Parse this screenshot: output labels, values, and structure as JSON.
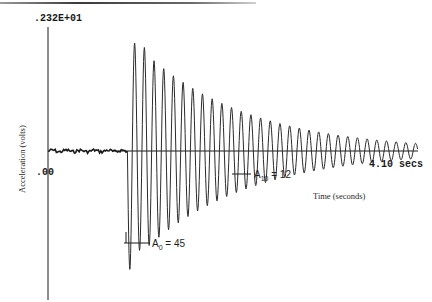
{
  "chart_data": {
    "type": "line",
    "title": "",
    "xlabel": "Time (seconds)",
    "ylabel": "Acceleration (volts)",
    "y_max_label": ".232E+01",
    "y_zero_label": ".00",
    "x_end_label": "4.10 secs",
    "ylim": [
      -2.32,
      2.32
    ],
    "xlim": [
      0,
      4.1
    ],
    "grid": false,
    "legend": null,
    "series": [
      {
        "name": "Acceleration",
        "description": "Damped free-vibration signal: flat noisy baseline until trigger (~0.9 s), then ~30 decaying oscillation cycles to 4.10 s",
        "trigger_time_s": 0.88,
        "approx_cycles": 30,
        "initial_amplitude_volts": 2.32,
        "final_amplitude_volts": 0.15
      }
    ],
    "annotations": [
      {
        "label": "A",
        "subscript": "0",
        "text": "= 45",
        "full": "A0 = 45"
      },
      {
        "label": "A",
        "subscript": "10",
        "text": "= 12",
        "full": "A10 = 12"
      }
    ]
  },
  "labels": {
    "y_max": ".232E+01",
    "y_zero": ".00",
    "y_axis_title": "Acceleration (volts)",
    "x_end": "4.10 secs",
    "x_axis_title": "Time (seconds)",
    "a0_base": "A",
    "a0_sub": "0",
    "a0_value": " = 45",
    "a10_base": "A",
    "a10_sub": "10",
    "a10_value": " = 12"
  },
  "colors": {
    "trace": "#2b2b2b",
    "axis": "#1a1a1a",
    "top_rule": "#6e6e6e",
    "background": "#ffffff"
  }
}
